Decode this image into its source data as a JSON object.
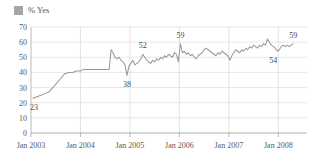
{
  "legend": {
    "swatch_color": "#a6a6a6",
    "label": "% Yes",
    "icon": "square-swatch-icon"
  },
  "chart_data": {
    "type": "line",
    "title": "",
    "subtitle": "",
    "xlabel": "",
    "ylabel": "",
    "grid": true,
    "legend_position": "top-left",
    "line_color": "#9a9a9a",
    "ylim": [
      0,
      70
    ],
    "yticks": [
      0,
      10,
      20,
      30,
      40,
      50,
      60,
      70
    ],
    "ytick_labels": [
      "0",
      "10",
      "20",
      "30",
      "40",
      "50",
      "60",
      "70"
    ],
    "xlim": [
      "Jan 2003",
      "Jul 2008"
    ],
    "xticks": [
      "Jan 2003",
      "Jan 2004",
      "Jan 2005",
      "Jan 2006",
      "Jan 2007",
      "Jan 2008"
    ],
    "xtick_labels": [
      "Jan 2003",
      "Jan 2004",
      "Jan 2005",
      "Jan 2006",
      "Jan 2007",
      "Jan 2008"
    ],
    "series": [
      {
        "name": "% Yes",
        "x": [
          2003.04,
          2003.12,
          2003.2,
          2003.28,
          2003.36,
          2003.44,
          2003.52,
          2003.6,
          2003.68,
          2003.76,
          2003.84,
          2003.92,
          2004.0,
          2004.06,
          2004.12,
          2004.18,
          2004.24,
          2004.3,
          2004.36,
          2004.42,
          2004.48,
          2004.54,
          2004.58,
          2004.62,
          2004.66,
          2004.7,
          2004.74,
          2004.78,
          2004.82,
          2004.86,
          2004.9,
          2004.94,
          2004.98,
          2005.02,
          2005.06,
          2005.1,
          2005.14,
          2005.18,
          2005.22,
          2005.26,
          2005.3,
          2005.34,
          2005.38,
          2005.42,
          2005.46,
          2005.5,
          2005.54,
          2005.58,
          2005.62,
          2005.66,
          2005.7,
          2005.74,
          2005.78,
          2005.82,
          2005.86,
          2005.9,
          2005.94,
          2005.98,
          2006.02,
          2006.06,
          2006.1,
          2006.14,
          2006.18,
          2006.22,
          2006.26,
          2006.3,
          2006.34,
          2006.38,
          2006.42,
          2006.46,
          2006.5,
          2006.54,
          2006.58,
          2006.62,
          2006.66,
          2006.7,
          2006.74,
          2006.78,
          2006.82,
          2006.86,
          2006.9,
          2006.94,
          2006.98,
          2007.02,
          2007.06,
          2007.1,
          2007.14,
          2007.18,
          2007.22,
          2007.26,
          2007.3,
          2007.34,
          2007.38,
          2007.42,
          2007.46,
          2007.5,
          2007.54,
          2007.58,
          2007.62,
          2007.66,
          2007.7,
          2007.74,
          2007.78,
          2007.82,
          2007.86,
          2007.9,
          2007.94,
          2007.98,
          2008.02,
          2008.06,
          2008.1,
          2008.14,
          2008.18,
          2008.22,
          2008.26,
          2008.3
        ],
        "values": [
          23,
          24,
          25,
          26,
          27,
          30,
          33,
          36,
          39,
          40,
          40,
          41,
          41,
          42,
          42,
          42,
          42,
          42,
          42,
          42,
          42,
          42,
          42,
          55,
          53,
          50,
          49,
          50,
          48,
          47,
          45,
          38,
          44,
          46,
          48,
          45,
          46,
          47,
          49,
          52,
          50,
          48,
          47,
          46,
          48,
          47,
          49,
          48,
          50,
          49,
          51,
          50,
          52,
          51,
          50,
          53,
          52,
          47,
          59,
          53,
          54,
          52,
          53,
          51,
          52,
          50,
          49,
          51,
          52,
          53,
          55,
          56,
          55,
          54,
          53,
          52,
          51,
          53,
          52,
          54,
          53,
          52,
          51,
          48,
          51,
          53,
          55,
          54,
          53,
          55,
          54,
          56,
          55,
          57,
          56,
          58,
          57,
          56,
          58,
          57,
          59,
          58,
          62,
          60,
          58,
          57,
          56,
          54,
          55,
          57,
          58,
          57,
          58,
          57,
          58,
          59
        ]
      }
    ],
    "annotations": [
      {
        "label": "23",
        "x": 2003.06,
        "y": 23,
        "position": "below"
      },
      {
        "label": "38",
        "x": 2004.94,
        "y": 38,
        "position": "below"
      },
      {
        "label": "52",
        "x": 2005.26,
        "y": 52,
        "position": "above"
      },
      {
        "label": "59",
        "x": 2006.02,
        "y": 59,
        "position": "above"
      },
      {
        "label": "54",
        "x": 2007.9,
        "y": 54,
        "position": "below"
      },
      {
        "label": "59",
        "x": 2008.3,
        "y": 59,
        "position": "above"
      }
    ]
  }
}
